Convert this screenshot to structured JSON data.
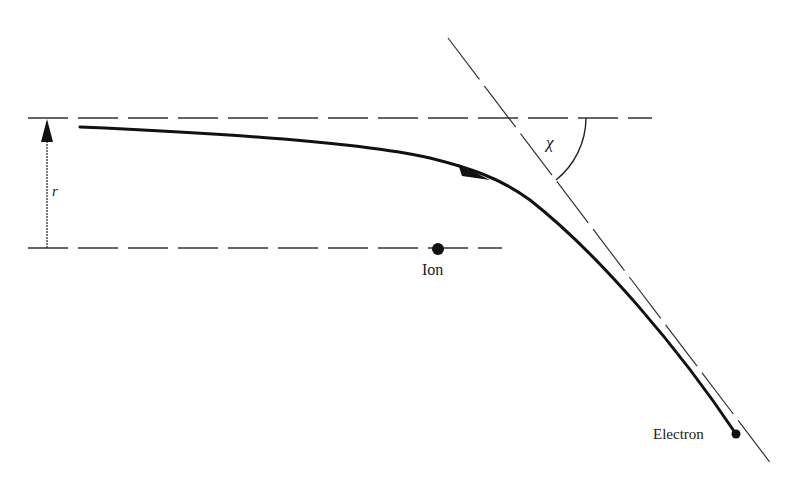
{
  "diagram": {
    "labels": {
      "impact_parameter": "r",
      "deflection_angle": "χ",
      "ion": "Ion",
      "electron": "Electron"
    },
    "elements": {
      "top_reference_line": {
        "x1": 28,
        "x2": 652,
        "y": 118,
        "style": "dashed"
      },
      "bottom_reference_line": {
        "x1": 28,
        "x2": 502,
        "y": 248,
        "style": "dashed"
      },
      "impact_parameter_arrow": {
        "x": 47,
        "y_from": 248,
        "y_to": 118
      },
      "asymptote_line": {
        "x1": 448,
        "y1": 38,
        "x2": 772,
        "y2": 465,
        "style": "long-dash"
      },
      "ion_point": {
        "x": 438,
        "y": 249
      },
      "electron_point": {
        "x": 736,
        "y": 434
      }
    },
    "colors": {
      "stroke": "#111111",
      "dashed": "#333333",
      "background": "#ffffff"
    }
  }
}
